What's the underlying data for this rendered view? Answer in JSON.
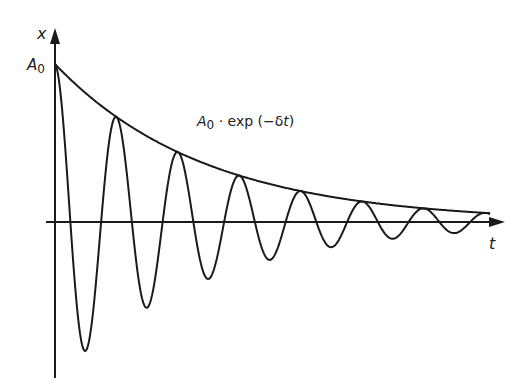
{
  "labels": {
    "y_axis": "x",
    "x_axis": "t",
    "amplitude": "A",
    "amplitude_sub": "0",
    "envelope_A": "A",
    "envelope_sub": "0",
    "envelope_rest": " · exp (−δ",
    "envelope_t": "t",
    "envelope_close": ")"
  },
  "colors": {
    "line": "#1a1a1a"
  },
  "chart_data": {
    "type": "line",
    "title": "",
    "xlabel": "t",
    "ylabel": "x",
    "annotations": [
      "A0",
      "A0 · exp(−δt)"
    ],
    "series": [
      {
        "name": "damped oscillation",
        "formula": "A0·exp(−δt)·cos(ωt)",
        "cycles": 7
      },
      {
        "name": "envelope",
        "formula": "A0·exp(−δt)"
      }
    ],
    "grid": false
  }
}
